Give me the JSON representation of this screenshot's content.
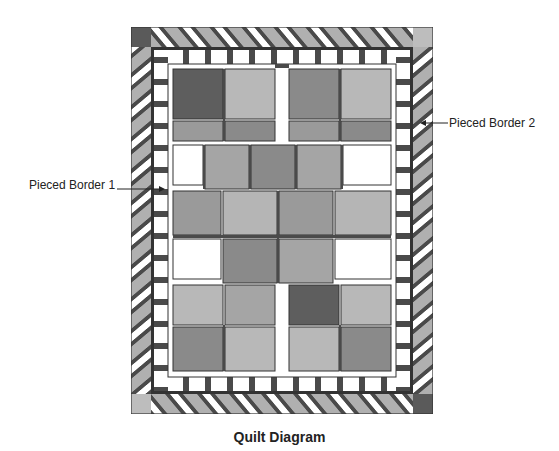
{
  "diagram": {
    "caption": "Quilt Diagram",
    "labels": [
      {
        "id": "pieced-border-1",
        "text": "Pieced Border 1"
      },
      {
        "id": "pieced-border-2",
        "text": "Pieced Border 2"
      }
    ],
    "colors": {
      "dark": "#4a4a4a",
      "medium": "#8c8c8c",
      "light": "#b4b4b4",
      "lighter": "#cfcfcf",
      "white": "#ffffff",
      "outline": "#333333"
    }
  }
}
